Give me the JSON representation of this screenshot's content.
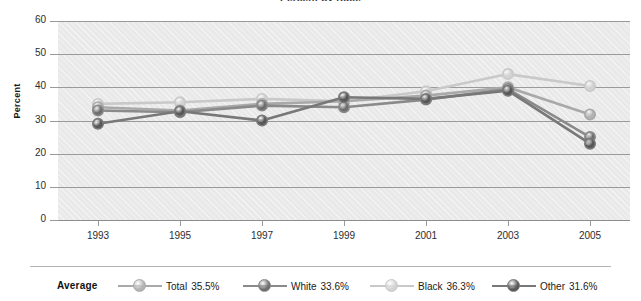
{
  "chart_data": {
    "type": "line",
    "title": "Percent by Race",
    "xlabel": "",
    "ylabel": "Percent",
    "categories": [
      "1993",
      "1995",
      "1997",
      "1999",
      "2001",
      "2003",
      "2005"
    ],
    "ylim": [
      0,
      60
    ],
    "yticks": [
      "0",
      "10",
      "20",
      "30",
      "40",
      "50",
      "60"
    ],
    "grid": true,
    "legend_position": "bottom",
    "legend_title": "Average",
    "series": [
      {
        "name": "Total",
        "average_label": "35.5%",
        "color": "#a9a9a9",
        "marker_color": "#b3b3b3",
        "values": [
          34.0,
          33.0,
          35.0,
          35.8,
          37.5,
          40.0,
          31.8
        ]
      },
      {
        "name": "White",
        "average_label": "33.6%",
        "color": "#8a8a8a",
        "marker_color": "#6e6e6e",
        "values": [
          33.0,
          32.5,
          34.5,
          34.0,
          36.3,
          39.5,
          25.0
        ]
      },
      {
        "name": "Black",
        "average_label": "36.3%",
        "color": "#c9c9c9",
        "marker_color": "#d2d2d2",
        "values": [
          35.0,
          35.5,
          36.5,
          35.8,
          38.8,
          44.0,
          40.4
        ]
      },
      {
        "name": "Other",
        "average_label": "31.6%",
        "color": "#787878",
        "marker_color": "#585858",
        "values": [
          29.0,
          32.8,
          30.0,
          37.0,
          36.5,
          39.0,
          23.0
        ]
      }
    ]
  }
}
